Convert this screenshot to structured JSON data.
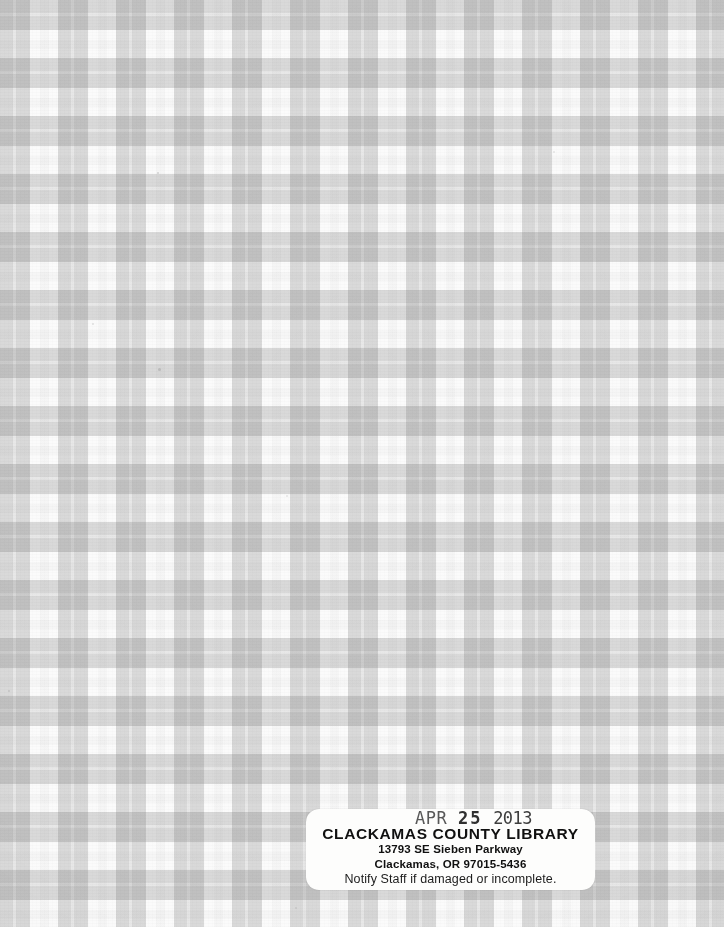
{
  "page": {
    "kind": "book-endpaper-scan",
    "width": 724,
    "height": 927
  },
  "background": {
    "name": "gingham-plaid-pattern",
    "description": "Gray and white gingham check cloth-pattern endpaper",
    "colors": {
      "white_square": "#fbfbfb",
      "light_gray_square": "#c8c8c8",
      "dark_gray_intersection": "#b4b4b4",
      "thin_seam": "#d6d6d6"
    },
    "geometry": {
      "cell_period_px": 58,
      "gray_band_px": 30,
      "white_gap_px": 28,
      "seam_width_px": 3
    }
  },
  "date_due_label": {
    "name": "clackamas-county-library-date-due-label",
    "shape": "rounded-rectangle",
    "background_color": "#fdfdfc",
    "bounds": {
      "x": 306,
      "y": 809,
      "width": 289,
      "height": 81
    },
    "stamp": {
      "month": "APR",
      "day": "25",
      "year": "2013",
      "full_text": "APR 25 2013",
      "ink_color": "#3d3d3d"
    },
    "library_name": "CLACKAMAS COUNTY LIBRARY",
    "street_address": "13793 SE Sieben Parkway",
    "city_state_zip": "Clackamas, OR 97015-5436",
    "notice": "Notify Staff if damaged or incomplete."
  }
}
